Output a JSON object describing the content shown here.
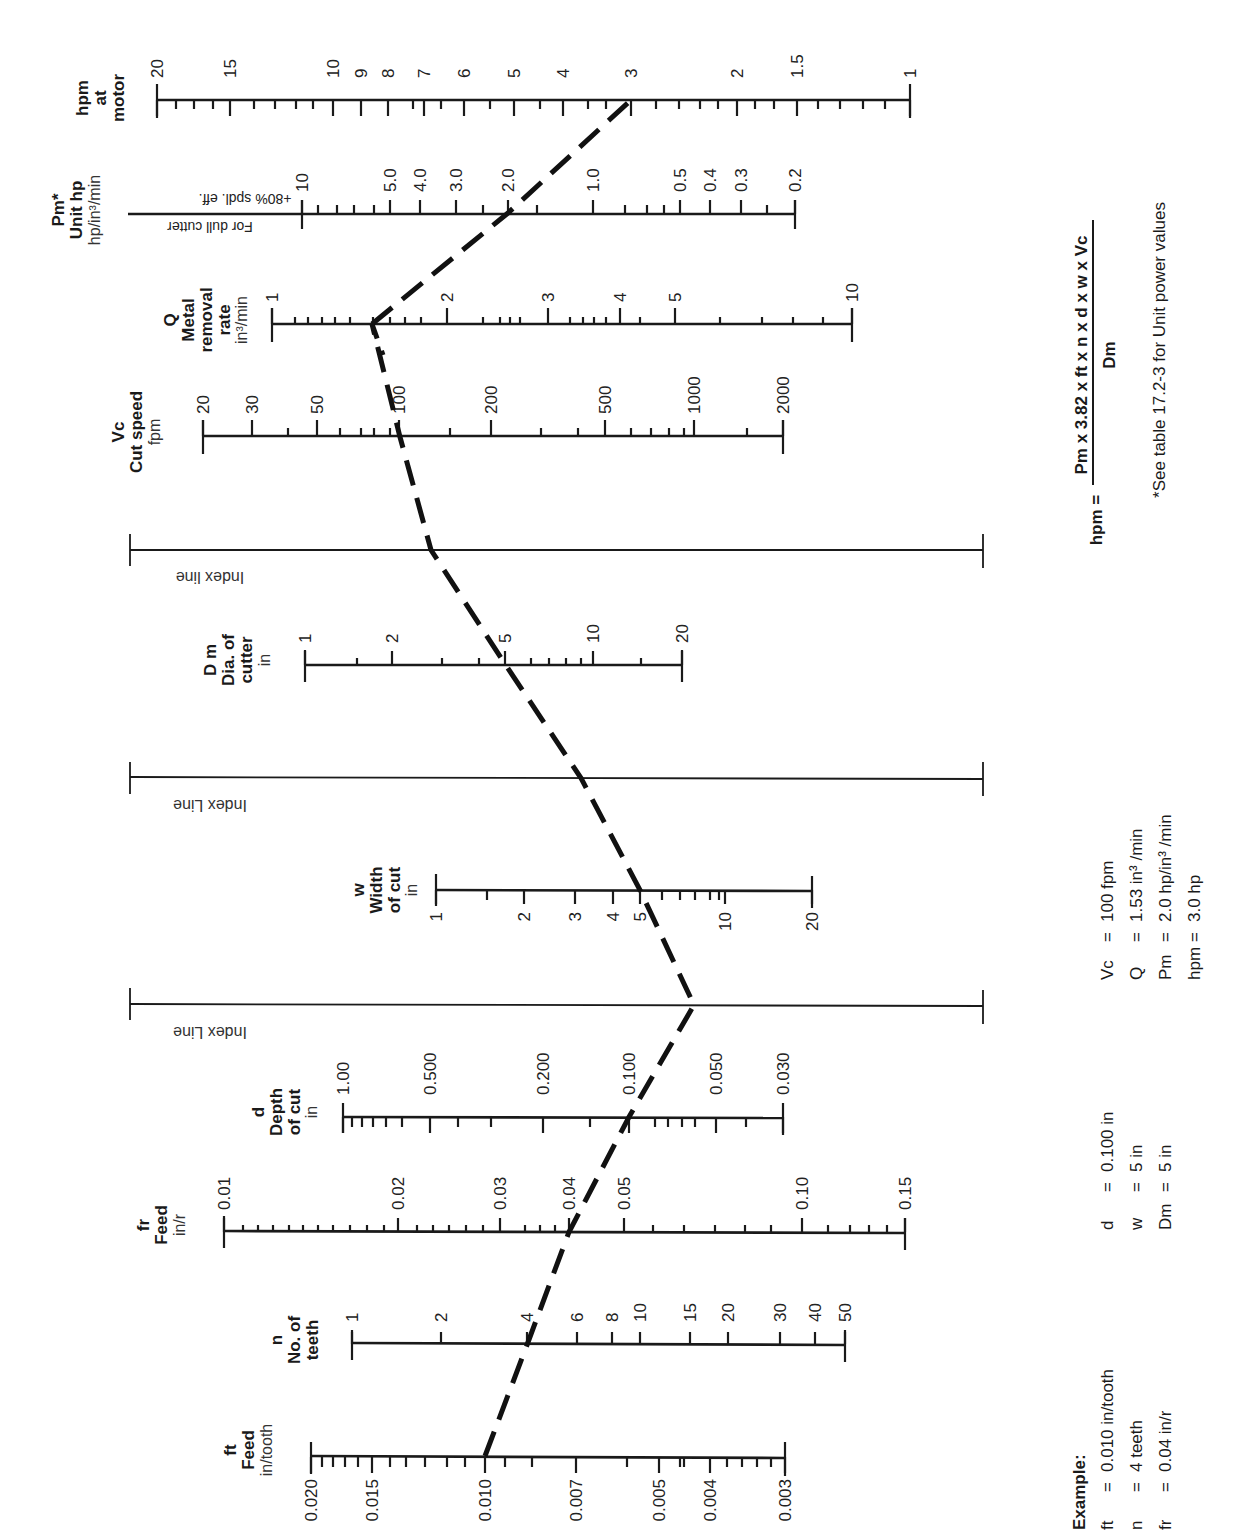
{
  "chart_data": {
    "type": "nomogram",
    "orientation": "rotated 90 degrees counter-clockwise",
    "scales": [
      {
        "id": "ft",
        "symbol": "ft",
        "name": "Feed",
        "unit": "in/tooth",
        "tick_labels": [
          "0.020",
          "0.015",
          "0.010",
          "0.007",
          "0.005",
          "0.004",
          "0.003"
        ]
      },
      {
        "id": "n",
        "symbol": "n",
        "name": "No. of teeth",
        "unit": "",
        "tick_labels": [
          "1",
          "2",
          "4",
          "6",
          "8",
          "10",
          "15",
          "20",
          "30",
          "40",
          "50"
        ]
      },
      {
        "id": "fr",
        "symbol": "fr",
        "name": "Feed",
        "unit": "in/r",
        "tick_labels": [
          "0.01",
          "0.02",
          "0.03",
          "0.04",
          "0.05",
          "0.10",
          "0.15"
        ]
      },
      {
        "id": "d",
        "symbol": "d",
        "name": "Depth of cut",
        "unit": "in",
        "tick_labels": [
          "1.00",
          "0.500",
          "0.200",
          "0.100",
          "0.050",
          "0.030"
        ]
      },
      {
        "id": "index3",
        "name": "Index Line"
      },
      {
        "id": "w",
        "symbol": "w",
        "name": "Width of cut",
        "unit": "in",
        "tick_labels": [
          "1",
          "2",
          "3",
          "4",
          "5",
          "10",
          "20"
        ]
      },
      {
        "id": "index2",
        "name": "Index Line"
      },
      {
        "id": "Dm",
        "symbol": "D m",
        "name": "Dia. of cutter",
        "unit": "in",
        "tick_labels": [
          "1",
          "2",
          "5",
          "10",
          "20"
        ]
      },
      {
        "id": "index1",
        "name": "Index line"
      },
      {
        "id": "Vc",
        "symbol": "Vc",
        "name": "Cut speed",
        "unit": "fpm",
        "tick_labels": [
          "20",
          "30",
          "50",
          "100",
          "200",
          "500",
          "1000",
          "2000"
        ]
      },
      {
        "id": "Q",
        "symbol": "Q",
        "name": "Metal removal rate",
        "unit": "in³/min",
        "tick_labels": [
          "1",
          "2",
          "3",
          "4",
          "5",
          "10"
        ]
      },
      {
        "id": "Pm",
        "symbol": "Pm*",
        "name": "Unit hp",
        "unit": "hp/in³/min",
        "tick_labels": [
          "10",
          "5.0",
          "4.0",
          "3.0",
          "2.0",
          "1.0",
          "0.5",
          "0.4",
          "0.3",
          "0.2"
        ],
        "notes": [
          "For dull cutter",
          "+80% spdl. eff."
        ]
      },
      {
        "id": "hpm",
        "symbol": "hpm",
        "name": "at motor",
        "unit": "",
        "tick_labels": [
          "20",
          "15",
          "10",
          "9",
          "8",
          "7",
          "6",
          "5",
          "4",
          "3",
          "2",
          "1.5",
          "1"
        ]
      }
    ],
    "example_path": [
      {
        "scale": "ft",
        "value": 0.01
      },
      {
        "scale": "n",
        "value": 4
      },
      {
        "scale": "fr",
        "value": 0.04
      },
      {
        "scale": "d",
        "value": 0.1
      },
      {
        "scale": "index3",
        "value": null
      },
      {
        "scale": "w",
        "value": 5
      },
      {
        "scale": "index2",
        "value": null
      },
      {
        "scale": "Dm",
        "value": 5
      },
      {
        "scale": "index1",
        "value": null
      },
      {
        "scale": "Vc",
        "value": 100
      },
      {
        "scale": "Q",
        "value": 1.53
      },
      {
        "scale": "Pm",
        "value": 2.0
      },
      {
        "scale": "hpm",
        "value": 3.0
      }
    ]
  },
  "labels": {
    "hpm": {
      "l1": "hpm",
      "l2": "at",
      "l3": "motor"
    },
    "pm": {
      "l1": "Pm*",
      "l2": "Unit hp",
      "l3": "hp/in³/min",
      "note1": "For dull cutter",
      "note2": "+80% spdl. eff."
    },
    "q": {
      "l1": "Q",
      "l2": "Metal",
      "l3": "removal",
      "l4": "rate",
      "l5": "in³/min"
    },
    "vc": {
      "l1": "Vc",
      "l2": "Cut speed",
      "l3": "fpm"
    },
    "index1": "Index line",
    "dm": {
      "l1": "D m",
      "l2": "Dia. of",
      "l3": "cutter",
      "l4": "in"
    },
    "index2": "Index Line",
    "w": {
      "l1": "w",
      "l2": "Width",
      "l3": "of cut",
      "l4": "in"
    },
    "index3": "Index Line",
    "d": {
      "l1": "d",
      "l2": "Depth",
      "l3": "of cut",
      "l4": "in"
    },
    "fr": {
      "l1": "fr",
      "l2": "Feed",
      "l3": "in/r"
    },
    "n": {
      "l1": "n",
      "l2": "No. of",
      "l3": "teeth"
    },
    "ft": {
      "l1": "ft",
      "l2": "Feed",
      "l3": "in/tooth"
    }
  },
  "formula": {
    "lhs": "hpm =",
    "numerator": "Pm x 3.82 x ft x n x d x w x Vc",
    "denominator": "Dm",
    "footnote": "*See table 17.2-3 for Unit power values"
  },
  "example": {
    "heading": "Example:",
    "col1": [
      {
        "sym": "ft",
        "eq": "=",
        "val": "0.010 in/tooth"
      },
      {
        "sym": "n",
        "eq": "=",
        "val": "4 teeth"
      },
      {
        "sym": "fr",
        "eq": "=",
        "val": "0.04 in/r"
      }
    ],
    "col2": [
      {
        "sym": "d",
        "eq": "=",
        "val": "0.100 in"
      },
      {
        "sym": "w",
        "eq": "=",
        "val": "5 in"
      },
      {
        "sym": "Dm",
        "eq": "=",
        "val": "5 in"
      }
    ],
    "col3": [
      {
        "sym": "Vc",
        "eq": "=",
        "val": "100 fpm"
      },
      {
        "sym": "Q",
        "eq": "=",
        "val": "1.53 in³ /min"
      },
      {
        "sym": "Pm",
        "eq": "=",
        "val": "2.0 hp/in³ /min"
      },
      {
        "sym": "hpm",
        "eq": "=",
        "val": "3.0 hp"
      }
    ]
  },
  "ticks": {
    "hpm": {
      "major": [
        [
          "20",
          157
        ],
        [
          "15",
          230
        ],
        [
          "10",
          333
        ],
        [
          "9",
          361
        ],
        [
          "8",
          388
        ],
        [
          "7",
          424
        ],
        [
          "6",
          464
        ],
        [
          "5",
          514
        ],
        [
          "4",
          563
        ],
        [
          "3",
          631
        ],
        [
          "2",
          737
        ],
        [
          "1.5",
          797
        ],
        [
          "1",
          910
        ]
      ],
      "minor": [
        176,
        194,
        213,
        254,
        275,
        296,
        313,
        413,
        441,
        490,
        540,
        588,
        606,
        656,
        679,
        700,
        718,
        755,
        774,
        818,
        840,
        863,
        885
      ]
    },
    "pm": {
      "major": [
        [
          "10",
          302
        ],
        [
          "5.0",
          390
        ],
        [
          "4.0",
          420
        ],
        [
          "3.0",
          456
        ],
        [
          "2.0",
          508
        ],
        [
          "1.0",
          593
        ],
        [
          "0.5",
          680
        ],
        [
          "0.4",
          710
        ],
        [
          "0.3",
          741
        ],
        [
          "0.2",
          795
        ]
      ],
      "minor": [
        318,
        337,
        354,
        374,
        483,
        537,
        625,
        647,
        664,
        767
      ]
    },
    "q": {
      "major": [
        [
          "1",
          272
        ],
        [
          "2",
          447
        ],
        [
          "3",
          548
        ],
        [
          "4",
          620
        ],
        [
          "5",
          675
        ],
        [
          "10",
          852
        ]
      ],
      "minor": [
        295,
        308,
        322,
        335,
        350,
        373,
        390,
        405,
        421,
        483,
        500,
        510,
        520,
        570,
        583,
        594,
        606,
        640,
        720,
        762,
        793,
        823
      ]
    },
    "vc": {
      "major": [
        [
          "20",
          203
        ],
        [
          "30",
          252
        ],
        [
          "50",
          317
        ],
        [
          "100",
          399
        ],
        [
          "200",
          491
        ],
        [
          "500",
          605
        ],
        [
          "1000",
          694
        ],
        [
          "2000",
          783
        ]
      ],
      "minor": [
        288,
        340,
        361,
        374,
        390,
        450,
        541,
        578,
        631,
        651,
        669,
        684,
        747
      ]
    },
    "dm": {
      "major": [
        [
          "1",
          305
        ],
        [
          "2",
          392
        ],
        [
          "5",
          505
        ],
        [
          "10",
          593
        ],
        [
          "20",
          682
        ]
      ],
      "minor": [
        357,
        442,
        479,
        531,
        549,
        566,
        581,
        641
      ]
    },
    "w": {
      "major": [
        [
          "1",
          436
        ],
        [
          "2",
          524
        ],
        [
          "3",
          575
        ],
        [
          "4",
          613
        ],
        [
          "5",
          640
        ],
        [
          "10",
          725
        ],
        [
          "20",
          812
        ]
      ],
      "minor": [
        487,
        662,
        680,
        695,
        710,
        719
      ]
    },
    "d": {
      "major": [
        [
          "1.00",
          343
        ],
        [
          "0.500",
          430
        ],
        [
          "0.200",
          543
        ],
        [
          "0.100",
          629
        ],
        [
          "0.050",
          716
        ],
        [
          "0.030",
          783
        ]
      ],
      "minor": [
        352,
        362,
        373,
        386,
        402,
        458,
        491,
        590,
        655,
        668,
        682,
        695,
        746
      ]
    },
    "fr": {
      "major": [
        [
          "0.01",
          224
        ],
        [
          "0.02",
          398
        ],
        [
          "0.03",
          500
        ],
        [
          "0.04",
          569
        ],
        [
          "0.05",
          624
        ],
        [
          "0.10",
          802
        ],
        [
          "0.15",
          905
        ]
      ],
      "minor": [
        243,
        258,
        273,
        289,
        303,
        318,
        333,
        350,
        367,
        384,
        417,
        433,
        449,
        466,
        483,
        525,
        540,
        555,
        653,
        684,
        715,
        745,
        771,
        828,
        850,
        869,
        887
      ]
    },
    "n": {
      "major": [
        [
          "1",
          352
        ],
        [
          "2",
          441
        ],
        [
          "4",
          527
        ],
        [
          "6",
          577
        ],
        [
          "8",
          612
        ],
        [
          "10",
          640
        ],
        [
          "15",
          690
        ],
        [
          "20",
          728
        ],
        [
          "30",
          780
        ],
        [
          "40",
          815
        ],
        [
          "50",
          845
        ]
      ],
      "minor": []
    },
    "ft": {
      "major": [
        [
          "0.020",
          311
        ],
        [
          "0.015",
          372
        ],
        [
          "0.010",
          485
        ],
        [
          "0.007",
          576
        ],
        [
          "0.005",
          659
        ],
        [
          "0.004",
          710
        ],
        [
          "0.003",
          785
        ]
      ],
      "minor": [
        322,
        333,
        345,
        358,
        390,
        406,
        425,
        447,
        465,
        505,
        532,
        627,
        680,
        684,
        727,
        742,
        757,
        771
      ]
    }
  }
}
